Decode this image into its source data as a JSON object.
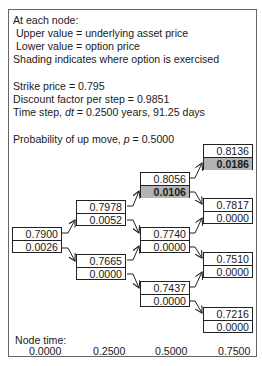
{
  "legend": {
    "line1": "At each node:",
    "line2": " Upper value = underlying asset price",
    "line3": " Lower value = option price",
    "line4": "Shading indicates where option is exercised"
  },
  "params": {
    "strike": "Strike price = 0.795",
    "discount": "Discount factor per step = 0.9851",
    "timestep_prefix": "Time step, ",
    "timestep_var": "dt",
    "timestep_suffix": " = 0.2500 years, 91.25 days",
    "prob_prefix": "Probability of up move, ",
    "prob_var": "p",
    "prob_suffix": " = 0.5000"
  },
  "colors": {
    "shade": "#b3b3b3",
    "border": "#222222"
  },
  "nodes": [
    {
      "id": "n00",
      "asset": "0.7900",
      "option": "0.0026",
      "exercised": false
    },
    {
      "id": "n10",
      "asset": "0.7978",
      "option": "0.0052",
      "exercised": false
    },
    {
      "id": "n11",
      "asset": "0.7665",
      "option": "0.0000",
      "exercised": false
    },
    {
      "id": "n20",
      "asset": "0.8056",
      "option": "0.0106",
      "exercised": true
    },
    {
      "id": "n21",
      "asset": "0.7740",
      "option": "0.0000",
      "exercised": false
    },
    {
      "id": "n22",
      "asset": "0.7437",
      "option": "0.0000",
      "exercised": false
    },
    {
      "id": "n30",
      "asset": "0.8136",
      "option": "0.0186",
      "exercised": true
    },
    {
      "id": "n31",
      "asset": "0.7817",
      "option": "0.0000",
      "exercised": false
    },
    {
      "id": "n32",
      "asset": "0.7510",
      "option": "0.0000",
      "exercised": false
    },
    {
      "id": "n33",
      "asset": "0.7216",
      "option": "0.0000",
      "exercised": false
    }
  ],
  "node_time": {
    "label": "Node time:",
    "values": [
      "0.0000",
      "0.2500",
      "0.5000",
      "0.7500"
    ]
  }
}
